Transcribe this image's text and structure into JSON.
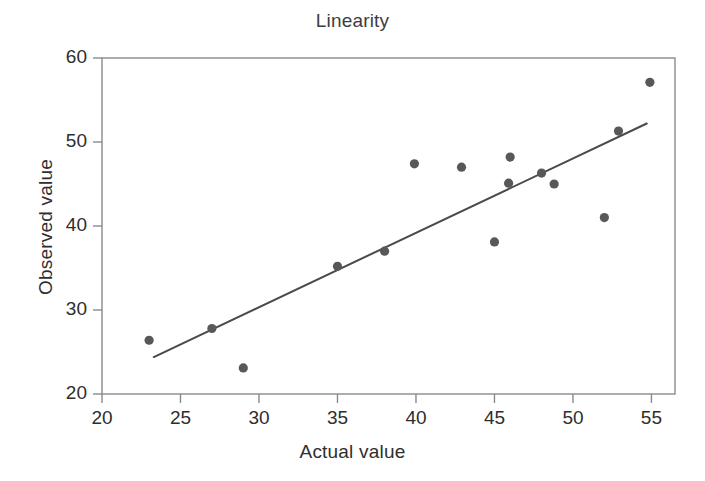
{
  "chart_data": {
    "type": "scatter",
    "title": "Linearity",
    "xlabel": "Actual value",
    "ylabel": "Observed value",
    "xlim": [
      20,
      56.5
    ],
    "ylim": [
      20,
      60
    ],
    "xticks": [
      20,
      25,
      30,
      35,
      40,
      45,
      50,
      55
    ],
    "yticks": [
      20,
      30,
      40,
      50,
      60
    ],
    "xtick_labels": [
      "20",
      "25",
      "30",
      "35",
      "40",
      "45",
      "50",
      "55"
    ],
    "ytick_labels": [
      "20",
      "30",
      "40",
      "50",
      "60"
    ],
    "grid": false,
    "legend": "none",
    "marker_color": "#585858",
    "line_color": "#4a4a4a",
    "axis_color": "#8a8a8a",
    "points": [
      {
        "x": 23.0,
        "y": 26.4
      },
      {
        "x": 27.0,
        "y": 27.8
      },
      {
        "x": 29.0,
        "y": 23.1
      },
      {
        "x": 35.0,
        "y": 35.2
      },
      {
        "x": 38.0,
        "y": 37.0
      },
      {
        "x": 39.9,
        "y": 47.4
      },
      {
        "x": 42.9,
        "y": 47.0
      },
      {
        "x": 45.0,
        "y": 38.1
      },
      {
        "x": 45.9,
        "y": 45.1
      },
      {
        "x": 46.0,
        "y": 48.2
      },
      {
        "x": 48.0,
        "y": 46.3
      },
      {
        "x": 48.8,
        "y": 45.0
      },
      {
        "x": 52.0,
        "y": 41.0
      },
      {
        "x": 52.9,
        "y": 51.3
      },
      {
        "x": 54.9,
        "y": 57.1
      }
    ],
    "fit_line": {
      "x0": 23.3,
      "y0": 24.4,
      "x1": 54.7,
      "y1": 52.2
    }
  }
}
